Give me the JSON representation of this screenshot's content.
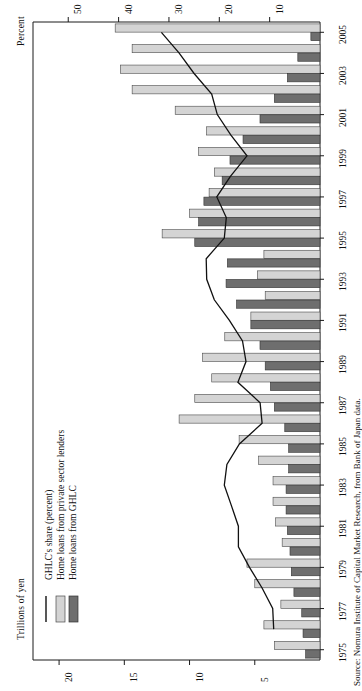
{
  "axes": {
    "top_axis_title": "Percent",
    "bottom_axis_title": "Trillions of yen",
    "percent_ticks": [
      50,
      40,
      30,
      20,
      10
    ],
    "percent_lim": [
      0,
      57
    ],
    "trillions_ticks": [
      20,
      15,
      10,
      5
    ],
    "trillions_lim": [
      0,
      22
    ]
  },
  "legend": {
    "items": [
      {
        "label": "GHLC's share (percent)",
        "type": "line",
        "color": "#111111"
      },
      {
        "label": "Home loans from private sector lenders",
        "type": "swatch",
        "color": "#d4d4d4"
      },
      {
        "label": "Home loans from GHLC",
        "type": "swatch",
        "color": "#6e6e6e"
      }
    ]
  },
  "source": {
    "text": "Source: Nomura Institute of Capital Market Research, from Bank of Japan data."
  },
  "chart_data": {
    "type": "bar",
    "title": "",
    "xlabel": "Trillions of yen",
    "ylabel": "Percent",
    "grid": false,
    "legend_position": "left-inner",
    "orientation": "horizontal-rotated",
    "categories": [
      "1975",
      "1976",
      "1977",
      "1978",
      "1979",
      "1980",
      "1981",
      "1982",
      "1983",
      "1984",
      "1985",
      "1986",
      "1987",
      "1988",
      "1989",
      "1990",
      "1991",
      "1992",
      "1993",
      "1994",
      "1995",
      "1996",
      "1997",
      "1998",
      "1999",
      "2000",
      "2001",
      "2002",
      "2003",
      "2004",
      "2005"
    ],
    "tick_labels": [
      "1975",
      "1977",
      "1979",
      "1981",
      "1983",
      "1985",
      "1987",
      "1989",
      "1991",
      "1993",
      "1995",
      "1997",
      "1999",
      "2001",
      "2003",
      "2005"
    ],
    "series": [
      {
        "name": "Home loans from private sector lenders",
        "unit": "trillions of yen",
        "color": "#d4d4d4",
        "values": [
          3.5,
          4.3,
          3.0,
          5.0,
          5.6,
          2.9,
          3.4,
          3.6,
          3.6,
          4.7,
          6.2,
          10.8,
          9.6,
          8.3,
          9.0,
          7.3,
          5.3,
          4.2,
          4.8,
          4.3,
          12.1,
          10.0,
          8.5,
          8.1,
          9.3,
          8.7,
          11.1,
          14.4,
          15.3,
          14.4,
          15.7
        ],
        "axis": "bottom"
      },
      {
        "name": "Home loans from GHLC",
        "unit": "trillions of yen",
        "color": "#6e6e6e",
        "values": [
          1.1,
          1.3,
          1.4,
          2.0,
          2.2,
          2.3,
          2.5,
          2.6,
          2.6,
          2.4,
          2.4,
          2.7,
          3.5,
          3.8,
          4.2,
          4.6,
          5.3,
          6.4,
          7.2,
          7.1,
          9.6,
          9.3,
          8.9,
          7.5,
          6.9,
          5.9,
          4.6,
          3.5,
          2.5,
          1.7,
          0.7
        ],
        "axis": "bottom"
      },
      {
        "name": "GHLC's share (percent)",
        "unit": "percent",
        "color": "#111111",
        "values": [
          null,
          9.2,
          9.4,
          11.5,
          14.0,
          16.2,
          16.2,
          17.6,
          19.0,
          18.5,
          16.0,
          11.5,
          11.9,
          16.3,
          14.7,
          15.4,
          18.0,
          21.0,
          22.5,
          22.6,
          19.0,
          18.6,
          20.5,
          17.8,
          14.5,
          17.7,
          20.4,
          21.5,
          25.0,
          28.0,
          31.5
        ],
        "axis": "top"
      }
    ]
  }
}
